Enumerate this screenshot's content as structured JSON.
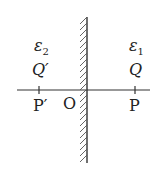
{
  "diagram": {
    "left_region": {
      "medium": "ε",
      "medium_sub": "2",
      "charge": "Q′",
      "point": "P′"
    },
    "right_region": {
      "medium": "ε",
      "medium_sub": "1",
      "charge": "Q",
      "point": "P"
    },
    "origin": "O",
    "colors": {
      "stroke": "#333333",
      "text": "#222222"
    }
  }
}
